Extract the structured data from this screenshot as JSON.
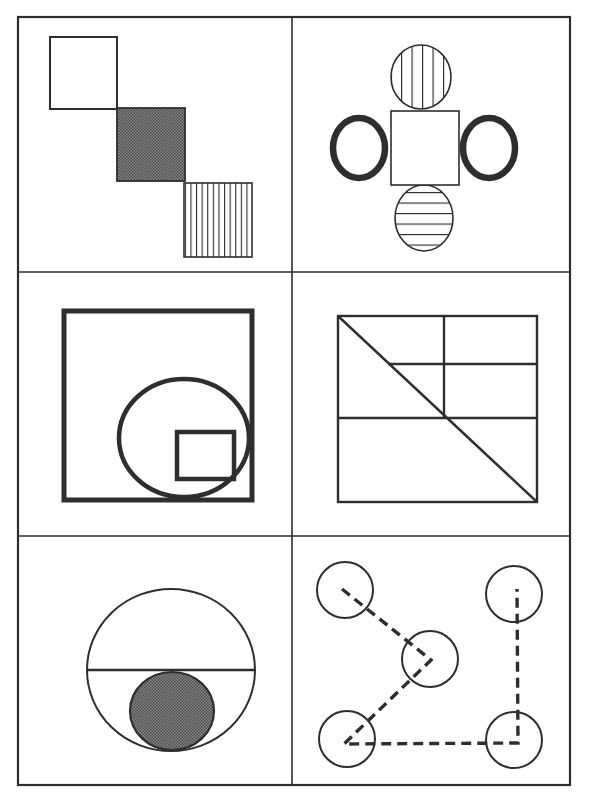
{
  "figure": {
    "grid": {
      "rows": 3,
      "cols": 2
    },
    "colors": {
      "line": "#2e2e2e",
      "fill_dark": "#6a6a6a",
      "background": "#ffffff"
    },
    "panels": [
      {
        "id": "panel-1",
        "description": "Three squares stepping diagonally: outlined, dark shaded, vertically striped"
      },
      {
        "id": "panel-2",
        "description": "Central square with vertically striped circle above, horizontally striped circle below, thick rings left and right"
      },
      {
        "id": "panel-3",
        "description": "Thick square containing an ellipse touching the bottom-right, with a small square inside the ellipse"
      },
      {
        "id": "panel-4",
        "description": "Rectangle divided by grid lines with a diagonal from top-left to bottom-right"
      },
      {
        "id": "panel-5",
        "description": "Large circle with a horizontal chord and a dark shaded small circle below the chord"
      },
      {
        "id": "panel-6",
        "description": "Five circles connected by a dashed path forming a zig-zag and an L shape"
      }
    ]
  }
}
